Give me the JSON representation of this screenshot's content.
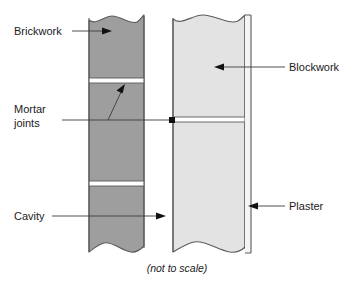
{
  "diagram": {
    "caption": "(not to scale)",
    "colors": {
      "brickwork_fill": "#9e9e9e",
      "blockwork_fill": "#e3e3e3",
      "plaster_fill": "#f5f5f5",
      "mortar_fill": "#ffffff",
      "outline": "#5a5a5a",
      "leader_line": "#3c3c3c",
      "arrow": "#111111",
      "text": "#1a1a1a",
      "background": "#ffffff"
    },
    "labels": [
      {
        "id": "brickwork",
        "text": "Brickwork",
        "x": 14,
        "y": 35,
        "anchor": "start",
        "side": "left"
      },
      {
        "id": "mortar-joints-line1",
        "text": "Mortar",
        "x": 14,
        "y": 113,
        "anchor": "start",
        "side": "left"
      },
      {
        "id": "mortar-joints-line2",
        "text": "joints",
        "x": 14,
        "y": 127,
        "anchor": "start",
        "side": "left"
      },
      {
        "id": "cavity",
        "text": "Cavity",
        "x": 14,
        "y": 220,
        "anchor": "start",
        "side": "left"
      },
      {
        "id": "blockwork",
        "text": "Blockwork",
        "x": 289,
        "y": 71,
        "anchor": "start",
        "side": "right"
      },
      {
        "id": "plaster",
        "text": "Plaster",
        "x": 289,
        "y": 210,
        "anchor": "start",
        "side": "right"
      }
    ],
    "layers": [
      {
        "id": "brickwork-column",
        "name": "Brickwork",
        "x": 89,
        "width": 55,
        "top": 14,
        "bottom": 253,
        "fill": "#9e9e9e"
      },
      {
        "id": "blockwork-column",
        "name": "Blockwork",
        "x": 173,
        "width": 72,
        "top": 14,
        "bottom": 253,
        "fill": "#e3e3e3"
      },
      {
        "id": "plaster-strip",
        "name": "Plaster",
        "x": 245,
        "width": 6,
        "top": 14,
        "bottom": 253,
        "fill": "#f5f5f5"
      }
    ],
    "mortar_joints": [
      {
        "id": "brick-joint-upper",
        "column": "brickwork",
        "y": 78,
        "height": 5
      },
      {
        "id": "brick-joint-lower",
        "column": "brickwork",
        "y": 181,
        "height": 5
      },
      {
        "id": "block-joint",
        "column": "blockwork",
        "y": 117,
        "height": 5
      }
    ],
    "cavity": {
      "id": "cavity-gap",
      "name": "Cavity",
      "x": 144,
      "width": 29
    }
  }
}
